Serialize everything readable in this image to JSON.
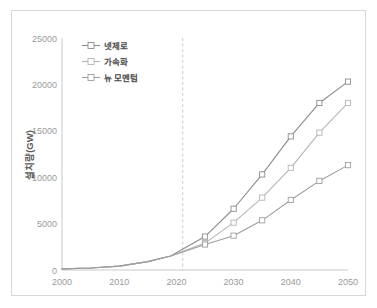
{
  "chart_data": {
    "type": "line",
    "title": "",
    "xlabel": "",
    "ylabel": "설치량(GW)",
    "xlim": [
      2000,
      2050
    ],
    "ylim": [
      0,
      25000
    ],
    "grid": false,
    "legend_position": "top-left",
    "x_ticks": [
      "2000",
      "2010",
      "2020",
      "2030",
      "2040",
      "2050"
    ],
    "y_ticks": [
      "0",
      "5000",
      "10000",
      "15000",
      "20000",
      "25000"
    ],
    "annotations": [
      {
        "name": "history-projection-divider",
        "type": "vertical-dashed-line",
        "x": 2019
      }
    ],
    "x": [
      2000,
      2005,
      2010,
      2015,
      2019,
      2025,
      2030,
      2035,
      2040,
      2045,
      2050
    ],
    "series": [
      {
        "name": "넷제로",
        "color": "#8c8c8c",
        "marker": "square-open",
        "values": [
          120,
          220,
          420,
          900,
          1500,
          3600,
          6600,
          10300,
          14400,
          18000,
          20300
        ],
        "marker_x": [
          2025,
          2030,
          2035,
          2040,
          2045,
          2050
        ],
        "marker_values": [
          3600,
          6600,
          10300,
          14400,
          18000,
          20300
        ]
      },
      {
        "name": "가속화",
        "color": "#b5b5b5",
        "marker": "square-open",
        "values": [
          120,
          220,
          420,
          900,
          1500,
          2900,
          5100,
          7800,
          11000,
          14800,
          18000
        ],
        "marker_x": [
          2025,
          2030,
          2035,
          2040,
          2045,
          2050
        ],
        "marker_values": [
          2900,
          5100,
          7800,
          11000,
          14800,
          18000
        ]
      },
      {
        "name": "뉴 모멘텀",
        "color": "#9e9e9e",
        "marker": "square-open",
        "values": [
          120,
          220,
          420,
          900,
          1500,
          2750,
          3700,
          5350,
          7550,
          9600,
          11300
        ],
        "marker_x": [
          2025,
          2030,
          2035,
          2040,
          2045,
          2050
        ],
        "marker_values": [
          2750,
          3700,
          5350,
          7550,
          9600,
          11300
        ]
      }
    ]
  },
  "axes": {
    "y_title": "설치량(GW)",
    "y_tick_0": "0",
    "y_tick_1": "5000",
    "y_tick_2": "10000",
    "y_tick_3": "15000",
    "y_tick_4": "20000",
    "y_tick_5": "25000",
    "x_tick_0": "2000",
    "x_tick_1": "2010",
    "x_tick_2": "2020",
    "x_tick_3": "2030",
    "x_tick_4": "2040",
    "x_tick_5": "2050"
  },
  "legend": {
    "items": [
      {
        "label": "넷제로",
        "color": "#8c8c8c"
      },
      {
        "label": "가속화",
        "color": "#b5b5b5"
      },
      {
        "label": "뉴 모멘텀",
        "color": "#9e9e9e"
      }
    ]
  }
}
